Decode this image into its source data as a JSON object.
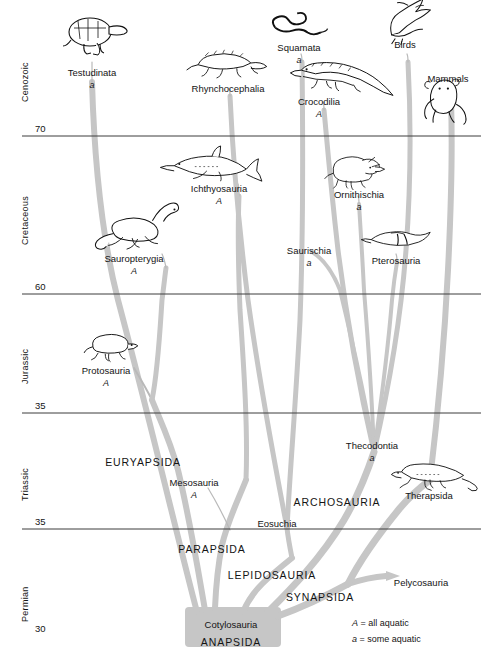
{
  "figure": {
    "type": "phylogenetic-tree",
    "width": 481,
    "height": 660,
    "colors": {
      "branch": "#c6c6c6",
      "trunk": "#c6c6c6",
      "axis_line": "#3c3c3c",
      "text": "#141414",
      "background": "#ffffff"
    }
  },
  "axis": {
    "name": "geologic-time-axis",
    "periods": [
      {
        "label": "Cenozoic",
        "top": 8,
        "bottom": 136
      },
      {
        "label": "Cretaceous",
        "top": 136,
        "bottom": 294
      },
      {
        "label": "Jurassic",
        "top": 294,
        "bottom": 413
      },
      {
        "label": "Triassic",
        "top": 413,
        "bottom": 529
      },
      {
        "label": "Permian",
        "top": 529,
        "bottom": 655
      }
    ],
    "ticks": [
      {
        "value": "70",
        "y": 136
      },
      {
        "value": "60",
        "y": 294
      },
      {
        "value": "35",
        "y": 413
      },
      {
        "value": "35",
        "y": 529
      },
      {
        "value": "30",
        "y": 636
      }
    ]
  },
  "legend": {
    "name": "aquatic-legend",
    "entries": [
      {
        "symbol": "A",
        "equals": "=",
        "text": "all aquatic"
      },
      {
        "symbol": "a",
        "equals": "=",
        "text": "some aquatic"
      }
    ]
  },
  "taxa": [
    {
      "id": "testudinata",
      "label": "Testudinata",
      "aquatic": "a",
      "x": 92,
      "y": 68,
      "style": "taxon",
      "icon": "tortoise-icon"
    },
    {
      "id": "rhynchocephalia",
      "label": "Rhynchocephalia",
      "aquatic": "",
      "x": 228,
      "y": 84,
      "style": "taxon",
      "icon": "lizard-icon"
    },
    {
      "id": "squamata",
      "label": "Squamata",
      "aquatic": "a",
      "x": 299,
      "y": 43,
      "style": "taxon",
      "icon": "snake-icon"
    },
    {
      "id": "birds",
      "label": "Birds",
      "aquatic": "",
      "x": 405,
      "y": 40,
      "style": "taxon",
      "icon": "bird-icon"
    },
    {
      "id": "crocodilia",
      "label": "Crocodilia",
      "aquatic": "A",
      "x": 319,
      "y": 97,
      "style": "taxon",
      "icon": "crocodile-icon"
    },
    {
      "id": "mammals",
      "label": "Mammals",
      "aquatic": "",
      "x": 448,
      "y": 74,
      "style": "taxon",
      "icon": "mammal-icon"
    },
    {
      "id": "ichthyosauria",
      "label": "Ichthyosauria",
      "aquatic": "A",
      "x": 219,
      "y": 184,
      "style": "taxon",
      "icon": "ichthyosaur-icon"
    },
    {
      "id": "ornithischia",
      "label": "Ornithischia",
      "aquatic": "a",
      "x": 359,
      "y": 190,
      "style": "taxon",
      "icon": "triceratops-icon"
    },
    {
      "id": "sauropterygia",
      "label": "Sauropterygia",
      "aquatic": "A",
      "x": 134,
      "y": 254,
      "style": "taxon",
      "icon": "plesiosaur-icon"
    },
    {
      "id": "saurischia",
      "label": "Saurischia",
      "aquatic": "a",
      "x": 309,
      "y": 246,
      "style": "taxon",
      "icon": ""
    },
    {
      "id": "pterosauria",
      "label": "Pterosauria",
      "aquatic": "",
      "x": 396,
      "y": 256,
      "style": "taxon",
      "icon": "pterosaur-icon"
    },
    {
      "id": "protosauria",
      "label": "Protosauria",
      "aquatic": "A",
      "x": 106,
      "y": 366,
      "style": "taxon",
      "icon": "protosaur-icon"
    },
    {
      "id": "thecodontia",
      "label": "Thecodontia",
      "aquatic": "a",
      "x": 372,
      "y": 441,
      "style": "taxon",
      "icon": ""
    },
    {
      "id": "therapsida",
      "label": "Therapsida",
      "aquatic": "",
      "x": 429,
      "y": 491,
      "style": "taxon",
      "icon": "therapsid-icon"
    },
    {
      "id": "mesosauria",
      "label": "Mesosauria",
      "aquatic": "A",
      "x": 194,
      "y": 478,
      "style": "taxon",
      "icon": ""
    },
    {
      "id": "eosuchia",
      "label": "Eosuchia",
      "aquatic": "",
      "x": 277,
      "y": 519,
      "style": "taxon",
      "icon": ""
    },
    {
      "id": "pelycosauria",
      "label": "Pelycosauria",
      "aquatic": "",
      "x": 421,
      "y": 578,
      "style": "taxon",
      "icon": ""
    },
    {
      "id": "cotylosauria",
      "label": "Cotylosauria",
      "aquatic": "",
      "x": 231,
      "y": 620,
      "style": "taxon",
      "icon": ""
    },
    {
      "id": "euryapsida",
      "label": "EURYAPSIDA",
      "aquatic": "",
      "x": 143,
      "y": 457,
      "style": "caps",
      "icon": ""
    },
    {
      "id": "archosauria",
      "label": "ARCHOSAURIA",
      "aquatic": "",
      "x": 337,
      "y": 497,
      "style": "caps",
      "icon": ""
    },
    {
      "id": "parapsida",
      "label": "PARAPSIDA",
      "aquatic": "",
      "x": 212,
      "y": 544,
      "style": "caps",
      "icon": ""
    },
    {
      "id": "lepidosauria",
      "label": "LEPIDOSAURIA",
      "aquatic": "",
      "x": 272,
      "y": 570,
      "style": "caps",
      "icon": ""
    },
    {
      "id": "synapsida",
      "label": "SYNAPSIDA",
      "aquatic": "",
      "x": 320,
      "y": 592,
      "style": "caps",
      "icon": ""
    },
    {
      "id": "anapsida",
      "label": "ANAPSIDA",
      "aquatic": "",
      "x": 231,
      "y": 637,
      "style": "caps",
      "icon": ""
    }
  ]
}
